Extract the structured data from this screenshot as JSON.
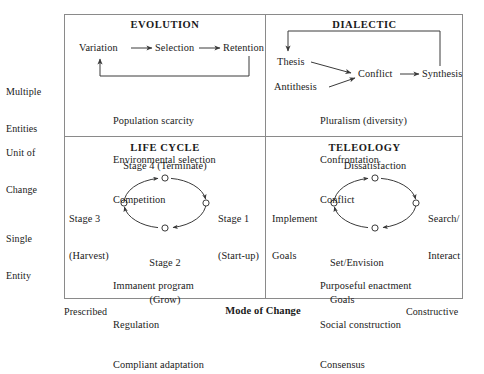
{
  "figure": {
    "frame_color": "#8a8a8a",
    "line_color": "#3a3a3a",
    "text_color": "#1a1a1a"
  },
  "axes": {
    "y_axis": {
      "top_label": "Multiple\nEntities",
      "top_label_line1": "Multiple",
      "top_label_line2": "Entities",
      "title_line1": "Unit of",
      "title_line2": "Change",
      "bottom_label_line1": "Single",
      "bottom_label_line2": "Entity"
    },
    "x_axis": {
      "left_label": "Prescribed",
      "title": "Mode of Change",
      "right_label": "Constructive"
    }
  },
  "quadrants": [
    {
      "id": "evolution",
      "title": "EVOLUTION",
      "nodes": [
        "Variation",
        "Selection",
        "Retention"
      ],
      "attributes": [
        "Population scarcity",
        "Environmental selection",
        "Competition"
      ],
      "attributes_text": "Population scarcity\nEnvironmental selection\nCompetition"
    },
    {
      "id": "dialectic",
      "title": "DIALECTIC",
      "nodes": [
        "Thesis",
        "Antithesis",
        "Conflict",
        "Synthesis"
      ],
      "attributes": [
        "Pluralism (diversity)",
        "Confrontation",
        "Conflict"
      ],
      "attributes_text": "Pluralism (diversity)\nConfrontation\nConflict"
    },
    {
      "id": "life-cycle",
      "title": "LIFE CYCLE",
      "stage_top": "Stage 4 (Terminate)",
      "stage_left_line1": "Stage 3",
      "stage_left_line2": "(Harvest)",
      "stage_right_line1": "Stage 1",
      "stage_right_line2": "(Start-up)",
      "stage_bottom_line1": "Stage 2",
      "stage_bottom_line2": "(Grow)",
      "attributes": [
        "Immanent program",
        "Regulation",
        "Compliant adaptation"
      ],
      "attributes_text": "Immanent program\nRegulation\nCompliant adaptation"
    },
    {
      "id": "teleology",
      "title": "TELEOLOGY",
      "stage_top": "Dissatisfaction",
      "stage_left_line1": "Implement",
      "stage_left_line2": "Goals",
      "stage_right_line1": "Search/",
      "stage_right_line2": "Interact",
      "stage_bottom_line1": "Set/Envision",
      "stage_bottom_line2": "Goals",
      "attributes": [
        "Purposeful enactment",
        "Social construction",
        "Consensus"
      ],
      "attributes_text": "Purposeful enactment\nSocial construction\nConsensus"
    }
  ]
}
